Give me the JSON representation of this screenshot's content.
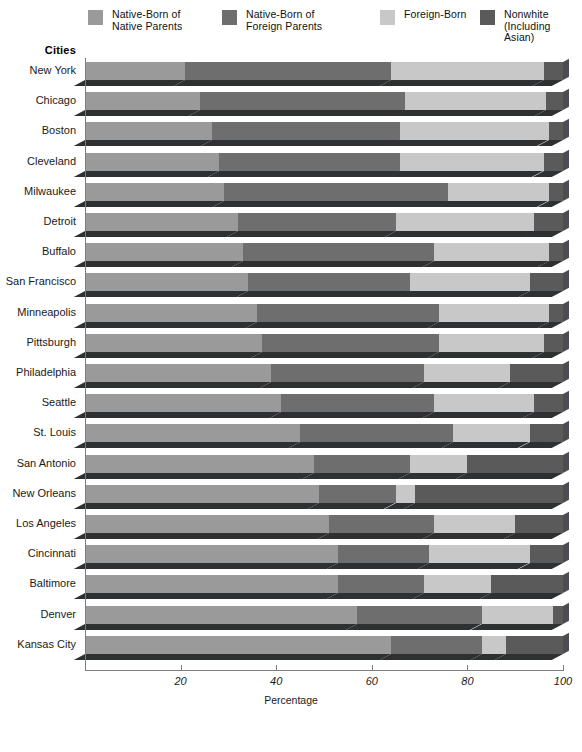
{
  "legend": {
    "items": [
      {
        "label": "Native-Born of\nNative Parents",
        "color": "#9a9a9a",
        "x": 88
      },
      {
        "label": "Native-Born of\nForeign Parents",
        "color": "#6e6e6e",
        "x": 222
      },
      {
        "label": "Foreign-Born",
        "color": "#c8c8c8",
        "x": 380
      },
      {
        "label": "Nonwhite\n(Including Asian)",
        "color": "#5a5a5a",
        "x": 480
      }
    ]
  },
  "axis": {
    "cities_header": "Cities",
    "xlabel": "Percentage",
    "ticks": [
      20,
      40,
      60,
      80,
      100
    ],
    "tick_labels": [
      "20",
      "40",
      "60",
      "80",
      "100"
    ]
  },
  "chart_data": {
    "type": "bar",
    "subtype": "stacked-horizontal-3d",
    "title": "",
    "xlabel": "Percentage",
    "ylabel": "Cities",
    "xlim": [
      0,
      100
    ],
    "grid": false,
    "legend_position": "top",
    "categories": [
      "New York",
      "Chicago",
      "Boston",
      "Cleveland",
      "Milwaukee",
      "Detroit",
      "Buffalo",
      "San Francisco",
      "Minneapolis",
      "Pittsburgh",
      "Philadelphia",
      "Seattle",
      "St. Louis",
      "San Antonio",
      "New Orleans",
      "Los Angeles",
      "Cincinnati",
      "Baltimore",
      "Denver",
      "Kansas City"
    ],
    "series": [
      {
        "name": "Native-Born of Native Parents",
        "color": "#9a9a9a",
        "values": [
          21,
          24,
          26.5,
          28,
          29,
          32,
          33,
          34,
          36,
          37,
          39,
          41,
          45,
          48,
          49,
          51,
          53,
          53,
          57,
          64
        ]
      },
      {
        "name": "Native-Born of Foreign Parents",
        "color": "#6e6e6e",
        "values": [
          43,
          43,
          39.5,
          38,
          47,
          33,
          40,
          34,
          38,
          37,
          32,
          32,
          32,
          20,
          16,
          22,
          19,
          18,
          26,
          19
        ]
      },
      {
        "name": "Foreign-Born",
        "color": "#c8c8c8",
        "values": [
          32,
          29.5,
          31,
          30,
          21,
          29,
          24,
          25,
          23,
          22,
          18,
          21,
          16,
          12,
          4,
          17,
          21,
          14,
          15,
          5
        ]
      },
      {
        "name": "Nonwhite (Including Asian)",
        "color": "#5a5a5a",
        "values": [
          4,
          3.5,
          3,
          4,
          3,
          6,
          3,
          7,
          3,
          4,
          11,
          6,
          7,
          20,
          31,
          10,
          7,
          15,
          2,
          12
        ]
      }
    ]
  }
}
